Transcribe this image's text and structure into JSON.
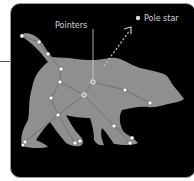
{
  "figure": {
    "labels": {
      "pointers": "Pointers",
      "pole_star": "Pole star"
    },
    "colors": {
      "background": "#000000",
      "bear": "#8f8f8f",
      "star": "#ffffff",
      "pointer_star": "#a0a0a0",
      "lines": "#6e6e6e",
      "label_text": "#d8d8d8",
      "arrow": "#c8c8c8"
    },
    "stars": [
      {
        "id": "tail-tip",
        "x": 22,
        "y": 36
      },
      {
        "id": "tail-2",
        "x": 39,
        "y": 42
      },
      {
        "id": "tail-3",
        "x": 48,
        "y": 54
      },
      {
        "id": "back-1",
        "x": 61,
        "y": 69
      },
      {
        "id": "back-2",
        "x": 60,
        "y": 82
      },
      {
        "id": "pointer-1",
        "x": 93,
        "y": 82,
        "pointer": true
      },
      {
        "id": "pointer-2",
        "x": 84,
        "y": 95,
        "pointer": true
      },
      {
        "id": "neck",
        "x": 125,
        "y": 90
      },
      {
        "id": "jaw",
        "x": 150,
        "y": 103
      },
      {
        "id": "hip",
        "x": 51,
        "y": 98
      },
      {
        "id": "belly",
        "x": 58,
        "y": 115
      },
      {
        "id": "front-leg",
        "x": 114,
        "y": 126
      },
      {
        "id": "back-paw-a",
        "x": 25,
        "y": 142
      },
      {
        "id": "back-paw-b",
        "x": 23,
        "y": 145
      },
      {
        "id": "mid-paw-a",
        "x": 75,
        "y": 143
      },
      {
        "id": "mid-paw-b",
        "x": 80,
        "y": 141
      },
      {
        "id": "front-paw-a",
        "x": 132,
        "y": 138
      },
      {
        "id": "front-paw-b",
        "x": 130,
        "y": 143
      }
    ]
  }
}
